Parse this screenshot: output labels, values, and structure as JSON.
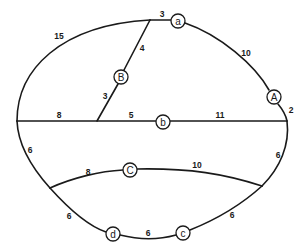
{
  "diagram": {
    "type": "weighted-graph",
    "nodes": [
      {
        "id": "a",
        "label": "a",
        "x": 178,
        "y": 21
      },
      {
        "id": "A",
        "label": "A",
        "x": 274,
        "y": 97
      },
      {
        "id": "B",
        "label": "B",
        "x": 121,
        "y": 77
      },
      {
        "id": "b",
        "label": "b",
        "x": 163,
        "y": 122
      },
      {
        "id": "C",
        "label": "C",
        "x": 130,
        "y": 170
      },
      {
        "id": "d",
        "label": "d",
        "x": 113,
        "y": 234
      },
      {
        "id": "c",
        "label": "c",
        "x": 183,
        "y": 233
      }
    ],
    "edge_labels": [
      {
        "id": "w-top-left-arc",
        "text": "15",
        "x": 59,
        "y": 36
      },
      {
        "id": "w-top-to-a",
        "text": "3",
        "x": 162,
        "y": 14
      },
      {
        "id": "w-a-to-A",
        "text": "10",
        "x": 246,
        "y": 53
      },
      {
        "id": "w-A-to-right",
        "text": "2",
        "x": 291,
        "y": 110
      },
      {
        "id": "w-top-to-B",
        "text": "4",
        "x": 142,
        "y": 48
      },
      {
        "id": "w-B-to-mid",
        "text": "3",
        "x": 105,
        "y": 96
      },
      {
        "id": "w-left-to-junction",
        "text": "8",
        "x": 59,
        "y": 115
      },
      {
        "id": "w-junction-to-b",
        "text": "5",
        "x": 131,
        "y": 115
      },
      {
        "id": "w-b-to-right",
        "text": "11",
        "x": 220,
        "y": 115
      },
      {
        "id": "w-left-lower",
        "text": "6",
        "x": 30,
        "y": 150
      },
      {
        "id": "w-right-lower",
        "text": "6",
        "x": 278,
        "y": 155
      },
      {
        "id": "w-left-to-C",
        "text": "8",
        "x": 88,
        "y": 172
      },
      {
        "id": "w-C-to-right",
        "text": "10",
        "x": 197,
        "y": 165
      },
      {
        "id": "w-left-to-d",
        "text": "6",
        "x": 69,
        "y": 216
      },
      {
        "id": "w-d-to-c",
        "text": "6",
        "x": 148,
        "y": 233
      },
      {
        "id": "w-c-to-right",
        "text": "6",
        "x": 232,
        "y": 215
      }
    ],
    "colors": {
      "stroke": "#1a1a1a",
      "background": "#ffffff"
    }
  }
}
